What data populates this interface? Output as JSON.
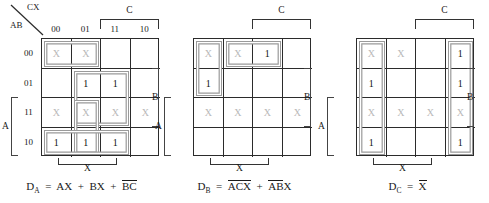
{
  "figure": {
    "colors": {
      "grid_line": "#2b2b2b",
      "group_outline": "#9a9a9a",
      "dontcare_text": "#b9b9b9",
      "one_text": "#111111",
      "bracket": "#333333"
    }
  },
  "axis": {
    "corner_top_label": "CX",
    "corner_bottom_label": "AB",
    "col_headers": [
      "00",
      "01",
      "11",
      "10"
    ],
    "row_headers": [
      "00",
      "01",
      "11",
      "10"
    ]
  },
  "brackets": {
    "c_label": "C",
    "x_label": "X",
    "a_label": "A",
    "b_label": "B"
  },
  "maps": [
    {
      "name": "D_A",
      "equation_var": "D",
      "equation_sub": "A",
      "equation_terms": [
        "AX",
        "BX",
        "B̅C̅"
      ],
      "equation_plain": "D_A = AX + BX + B'C'",
      "cells": [
        [
          "X",
          "X",
          "",
          ""
        ],
        [
          "",
          "1",
          "1",
          ""
        ],
        [
          "X",
          "X",
          "X",
          "X"
        ],
        [
          "1",
          "1",
          "1",
          ""
        ]
      ],
      "groups": [
        {
          "name": "group-row00-cols00-01",
          "row": 0,
          "col": 0,
          "rows": 1,
          "cols": 2
        },
        {
          "name": "group-rows01-11-cols01-11",
          "row": 1,
          "col": 1,
          "rows": 2,
          "cols": 2
        },
        {
          "name": "group-rows11-10-cols01",
          "row": 2,
          "col": 1,
          "rows": 2,
          "cols": 1
        },
        {
          "name": "group-row10-cols00-11",
          "row": 3,
          "col": 0,
          "rows": 1,
          "cols": 3
        }
      ]
    },
    {
      "name": "D_B",
      "equation_var": "D",
      "equation_sub": "B",
      "equation_terms": [
        "A̅C̅X̅",
        "A̅B̅X"
      ],
      "equation_plain": "D_B = A'C'X' + A'B'X",
      "cells": [
        [
          "X",
          "X",
          "1",
          ""
        ],
        [
          "1",
          "",
          "",
          ""
        ],
        [
          "X",
          "X",
          "X",
          "X"
        ],
        [
          "",
          "",
          "",
          ""
        ]
      ],
      "groups": [
        {
          "name": "group-rows00-01-col00",
          "row": 0,
          "col": 0,
          "rows": 2,
          "cols": 1
        },
        {
          "name": "group-row00-cols01-11",
          "row": 0,
          "col": 1,
          "rows": 1,
          "cols": 2
        }
      ]
    },
    {
      "name": "D_C",
      "equation_var": "D",
      "equation_sub": "C",
      "equation_terms": [
        "X̅"
      ],
      "equation_plain": "D_C = X'",
      "cells": [
        [
          "X",
          "X",
          "",
          "1"
        ],
        [
          "1",
          "",
          "",
          "1"
        ],
        [
          "X",
          "X",
          "X",
          "X"
        ],
        [
          "1",
          "",
          "",
          "1"
        ]
      ],
      "groups": [
        {
          "name": "group-col00-all-rows",
          "row": 0,
          "col": 0,
          "rows": 4,
          "cols": 1
        },
        {
          "name": "group-col10-all-rows",
          "row": 0,
          "col": 3,
          "rows": 4,
          "cols": 1
        }
      ]
    }
  ]
}
